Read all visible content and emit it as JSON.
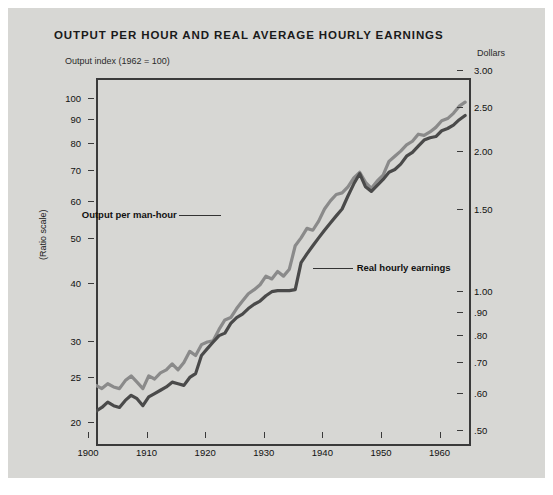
{
  "title": "OUTPUT PER HOUR AND REAL AVERAGE HOURLY EARNINGS",
  "left_unit_label": "Output index (1962 = 100)",
  "right_unit_label": "Dollars",
  "ratio_scale_label": "(Ratio scale)",
  "colors": {
    "card_background": "#d7d7d4",
    "page_background": "#ffffff",
    "axis": "#3a3a3a",
    "text": "#111111",
    "output_series": "#8a8a8a",
    "earnings_series": "#4a4a4a"
  },
  "chart_data": {
    "type": "line",
    "title": "OUTPUT PER HOUR AND REAL AVERAGE HOURLY EARNINGS",
    "xlabel": "",
    "ylabel": "Output index (1962 = 100)",
    "y2label": "Dollars",
    "scale": "log",
    "grid": false,
    "legend": "inline-annotations",
    "xlim": [
      1900,
      1964
    ],
    "xticks": [
      "1900",
      "1910",
      "1920",
      "1930",
      "1940",
      "1950",
      "1960"
    ],
    "xtick_values": [
      1900,
      1910,
      1920,
      1930,
      1940,
      1950,
      1960
    ],
    "ylim": [
      18.5,
      115
    ],
    "yticks": [
      "20",
      "25",
      "30",
      "40",
      "50",
      "60",
      "70",
      "80",
      "90",
      "100"
    ],
    "ytick_values": [
      20,
      25,
      30,
      40,
      50,
      60,
      70,
      80,
      90,
      100
    ],
    "y2lim": [
      0.48,
      3.0
    ],
    "y2ticks": [
      ".50",
      ".60",
      ".70",
      ".80",
      ".90",
      "1.00",
      "1.50",
      "2.00",
      "2.50",
      "3.00"
    ],
    "y2tick_values": [
      0.5,
      0.6,
      0.7,
      0.8,
      0.9,
      1.0,
      1.5,
      2.0,
      2.5,
      3.0
    ],
    "annotations": [
      {
        "text": "Output per man-hour",
        "x": 1923,
        "y": 56
      },
      {
        "text": "Real hourly earnings",
        "x": 1938,
        "y": 43
      }
    ],
    "series": [
      {
        "name": "Output per man-hour",
        "color": "#8a8a8a",
        "x": [
          1900,
          1901,
          1902,
          1903,
          1904,
          1905,
          1906,
          1907,
          1908,
          1909,
          1910,
          1911,
          1912,
          1913,
          1914,
          1915,
          1916,
          1917,
          1918,
          1919,
          1920,
          1921,
          1922,
          1923,
          1924,
          1925,
          1926,
          1927,
          1928,
          1929,
          1930,
          1931,
          1932,
          1933,
          1934,
          1935,
          1936,
          1937,
          1938,
          1939,
          1940,
          1941,
          1942,
          1943,
          1944,
          1945,
          1946,
          1947,
          1948,
          1949,
          1950,
          1951,
          1952,
          1953,
          1954,
          1955,
          1956,
          1957,
          1958,
          1959,
          1960,
          1961,
          1962,
          1963
        ],
        "values": [
          25.0,
          24.6,
          25.2,
          24.8,
          24.6,
          25.6,
          26.2,
          25.4,
          24.6,
          26.2,
          25.8,
          26.6,
          27.0,
          27.8,
          27.0,
          28.0,
          29.6,
          29.0,
          30.6,
          31.0,
          31.2,
          33.0,
          34.6,
          35.0,
          36.6,
          38.0,
          39.4,
          40.2,
          41.2,
          43.0,
          42.4,
          44.0,
          43.0,
          44.5,
          50.0,
          52.0,
          54.5,
          54.0,
          56.5,
          60.0,
          62.5,
          64.5,
          65.0,
          67.0,
          70.0,
          72.0,
          68.5,
          66.5,
          69.0,
          71.0,
          76.0,
          78.0,
          80.0,
          82.5,
          84.0,
          87.0,
          86.5,
          88.0,
          90.0,
          93.0,
          94.0,
          96.5,
          100.0,
          102.0
        ]
      },
      {
        "name": "Real hourly earnings",
        "color": "#4a4a4a",
        "x": [
          1900,
          1901,
          1902,
          1903,
          1904,
          1905,
          1906,
          1907,
          1908,
          1909,
          1910,
          1911,
          1912,
          1913,
          1914,
          1915,
          1916,
          1917,
          1918,
          1919,
          1920,
          1921,
          1922,
          1923,
          1924,
          1925,
          1926,
          1927,
          1928,
          1929,
          1930,
          1931,
          1932,
          1933,
          1934,
          1935,
          1936,
          1937,
          1938,
          1939,
          1940,
          1941,
          1942,
          1943,
          1944,
          1945,
          1946,
          1947,
          1948,
          1949,
          1950,
          1951,
          1952,
          1953,
          1954,
          1955,
          1956,
          1957,
          1958,
          1959,
          1960,
          1961,
          1962,
          1963
        ],
        "values": [
          22.0,
          22.4,
          23.0,
          22.6,
          22.4,
          23.2,
          23.8,
          23.4,
          22.6,
          23.6,
          24.0,
          24.4,
          24.8,
          25.4,
          25.2,
          25.0,
          26.0,
          26.5,
          29.0,
          30.0,
          31.0,
          32.0,
          32.4,
          34.0,
          35.0,
          35.6,
          36.6,
          37.4,
          38.0,
          39.0,
          39.8,
          40.0,
          40.0,
          40.0,
          40.2,
          46.0,
          48.0,
          50.0,
          52.0,
          54.0,
          56.0,
          58.0,
          60.0,
          64.0,
          68.0,
          71.5,
          67.0,
          65.5,
          67.5,
          69.5,
          72.0,
          73.0,
          75.0,
          78.0,
          79.5,
          82.0,
          84.5,
          85.5,
          86.0,
          88.5,
          89.5,
          91.0,
          93.5,
          95.5
        ]
      }
    ]
  }
}
